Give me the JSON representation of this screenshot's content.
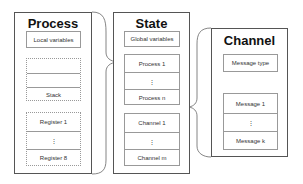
{
  "process": {
    "title": "Process",
    "local_variables": "Local variables",
    "stack": [
      "",
      "",
      "Stack"
    ],
    "registers": [
      "Register 1",
      "⋮",
      "Register 8"
    ]
  },
  "state": {
    "title": "State",
    "global_variables": "Global variables",
    "processes": [
      "Process 1",
      "⋮",
      "Process n"
    ],
    "channels": [
      "Channel 1",
      "⋮",
      "Channel m"
    ]
  },
  "channel": {
    "title": "Channel",
    "message_type": "Message type",
    "messages": [
      "Message 1",
      "⋮",
      "Message k"
    ]
  }
}
